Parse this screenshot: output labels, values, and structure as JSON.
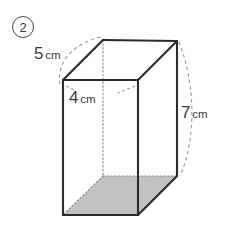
{
  "problem": {
    "item_number": "2",
    "shape_name": "rectangular-prism"
  },
  "dimensions": {
    "width": {
      "number": "4",
      "unit": "cm",
      "edge": "front-bottom-width"
    },
    "depth": {
      "number": "5",
      "unit": "cm",
      "edge": "top-left-depth"
    },
    "height": {
      "number": "7",
      "unit": "cm",
      "edge": "back-right-vertical"
    }
  },
  "colors": {
    "stroke": "#2b2b2b",
    "hidden_stroke": "#8c8c8c",
    "dashed_guide": "#9a9a9a",
    "base_fill": "#c2c2c2",
    "background": "#ffffff",
    "text": "#3a3a3a"
  },
  "geometry": {
    "front_top_left": [
      63,
      80
    ],
    "front_top_right": [
      138,
      80
    ],
    "front_bottom_right": [
      138,
      215
    ],
    "front_bottom_left": [
      63,
      215
    ],
    "back_top_left": [
      103,
      40
    ],
    "back_top_right": [
      177,
      41
    ],
    "back_bottom_right": [
      177,
      176
    ],
    "back_bottom_left": [
      103,
      176
    ]
  }
}
